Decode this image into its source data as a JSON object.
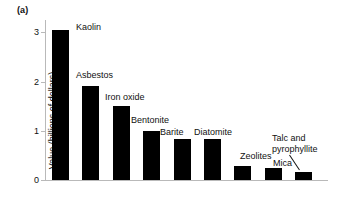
{
  "figure": {
    "panel_label": "(a)"
  },
  "chart_data": {
    "type": "bar",
    "title": "",
    "xlabel": "",
    "ylabel": "Value (billions of dollars)",
    "ylim": [
      0,
      3.25
    ],
    "yticks": [
      0,
      1,
      2,
      3
    ],
    "ytick_labels": [
      "0",
      "1",
      "2",
      "3"
    ],
    "grid": false,
    "legend": "none",
    "bar_color": "#000000",
    "axis_color": "#b9b9b9",
    "categories": [
      "Kaolin",
      "Asbestos",
      "Iron oxide",
      "Bentonite",
      "Barite",
      "Diatomite",
      "Zeolites",
      "Mica",
      "Talc and\npyrophyllite"
    ],
    "values": [
      3.05,
      1.9,
      1.5,
      1.0,
      0.84,
      0.83,
      0.28,
      0.24,
      0.16
    ],
    "labels": [
      {
        "text": "Kaolin",
        "left": 76,
        "top": 22
      },
      {
        "text": "Asbestos",
        "left": 76,
        "top": 70
      },
      {
        "text": "Iron oxide",
        "left": 105,
        "top": 92
      },
      {
        "text": "Bentonite",
        "left": 131,
        "top": 115
      },
      {
        "text": "Barite",
        "left": 160,
        "top": 127
      },
      {
        "text": "Diatomite",
        "left": 194,
        "top": 127
      },
      {
        "text": "Zeolites",
        "left": 240,
        "top": 151
      },
      {
        "text": "Mica",
        "left": 273,
        "top": 158
      },
      {
        "text": "Talc and\npyrophyllite",
        "left": 272,
        "top": 133
      }
    ],
    "leader_line": {
      "from_x": 289,
      "from_y": 155,
      "to_x": 299,
      "to_y": 170
    }
  }
}
